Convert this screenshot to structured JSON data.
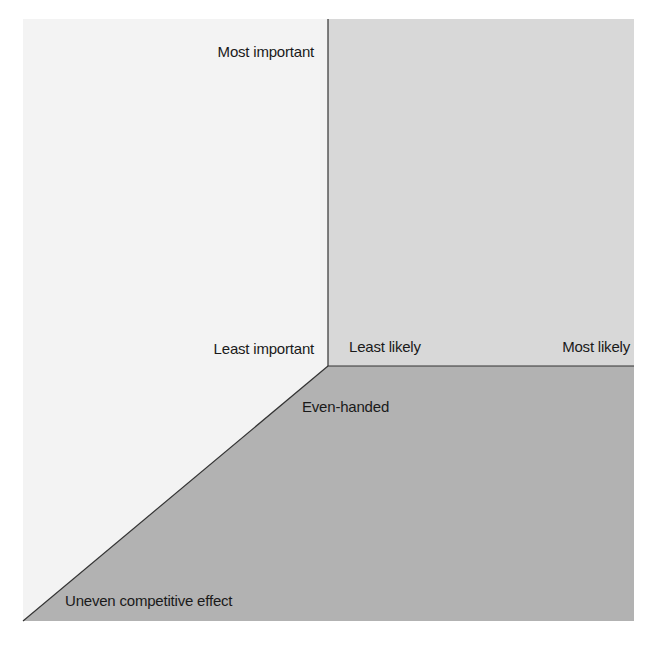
{
  "diagram": {
    "regions": {
      "left": {
        "name": "importance-panel",
        "color": "#f3f3f3"
      },
      "top_right": {
        "name": "likelihood-panel",
        "color": "#d8d8d8"
      },
      "bottom": {
        "name": "competitive-effect-panel",
        "color": "#b2b2b2"
      }
    },
    "line_color": "#333333",
    "labels": {
      "most_important": "Most important",
      "least_important": "Least important",
      "least_likely": "Least likely",
      "most_likely": "Most likely",
      "even_handed": "Even-handed",
      "uneven_competitive_effect": "Uneven competitive effect"
    }
  }
}
